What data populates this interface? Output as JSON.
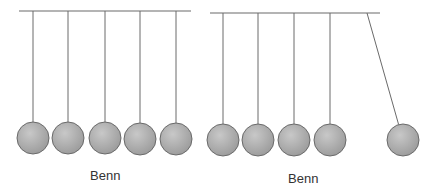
{
  "diagram": {
    "type": "newtons-cradle-comparison",
    "colors": {
      "line": "#6a6a6a",
      "ball_fill_light": "#c8c8c8",
      "ball_fill_dark": "#9a9a9a",
      "ball_stroke": "#6a6a6a"
    },
    "panels": [
      {
        "id": "left",
        "caption": "Benn",
        "bar": {
          "x1": 19,
          "x2": 191,
          "y": 11
        },
        "balls": [
          {
            "cx": 33,
            "cy": 138,
            "r": 16,
            "pivot_x": 33
          },
          {
            "cx": 68,
            "cy": 138,
            "r": 16,
            "pivot_x": 68
          },
          {
            "cx": 105,
            "cy": 138,
            "r": 16,
            "pivot_x": 105
          },
          {
            "cx": 140,
            "cy": 139,
            "r": 16,
            "pivot_x": 140
          },
          {
            "cx": 176,
            "cy": 139,
            "r": 16,
            "pivot_x": 176
          }
        ]
      },
      {
        "id": "right",
        "caption": "Benn",
        "bar": {
          "x1": 210,
          "x2": 380,
          "y": 13
        },
        "balls": [
          {
            "cx": 223,
            "cy": 140,
            "r": 16,
            "pivot_x": 223
          },
          {
            "cx": 258,
            "cy": 140,
            "r": 16,
            "pivot_x": 258
          },
          {
            "cx": 294,
            "cy": 140,
            "r": 16,
            "pivot_x": 294
          },
          {
            "cx": 330,
            "cy": 140,
            "r": 16,
            "pivot_x": 330
          },
          {
            "cx": 403,
            "cy": 140,
            "r": 16,
            "pivot_x": 367,
            "swinging": true
          }
        ]
      }
    ]
  }
}
